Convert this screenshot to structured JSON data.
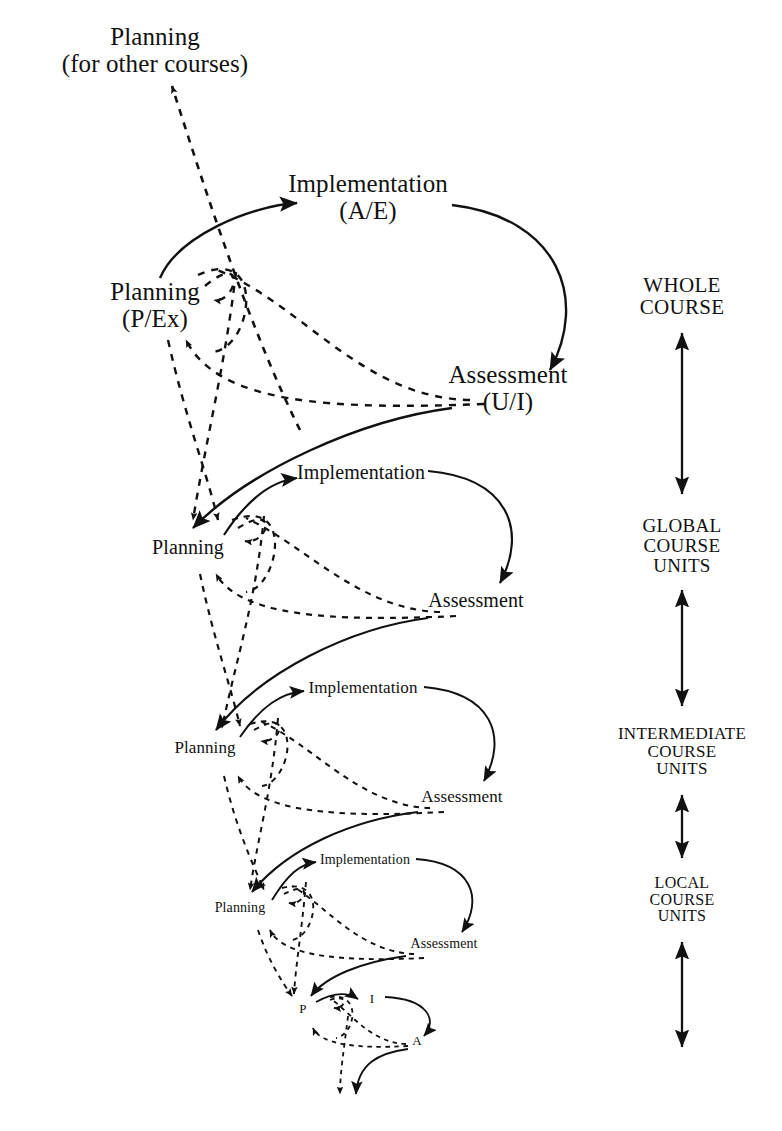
{
  "figure": {
    "background_color": "#ffffff",
    "ink_color": "#111111",
    "width": 782,
    "height": 1131
  },
  "nodes": {
    "external_planning": {
      "label": "Planning",
      "sublabel": "(for other courses)",
      "x": 155,
      "y": 50,
      "font_size": 25
    },
    "level1": {
      "planning": {
        "label": "Planning",
        "sublabel": "(P/Ex)",
        "x": 155,
        "y": 305,
        "font_size": 25
      },
      "implementation": {
        "label": "Implementation",
        "sublabel": "(A/E)",
        "x": 368,
        "y": 197,
        "font_size": 25
      },
      "assessment": {
        "label": "Assessment",
        "sublabel": "(U/I)",
        "x": 508,
        "y": 388,
        "font_size": 25
      }
    },
    "level2": {
      "planning": {
        "label": "Planning",
        "sublabel": "",
        "x": 188,
        "y": 548,
        "font_size": 20
      },
      "implementation": {
        "label": "Implementation",
        "sublabel": "",
        "x": 361,
        "y": 473,
        "font_size": 20
      },
      "assessment": {
        "label": "Assessment",
        "sublabel": "",
        "x": 476,
        "y": 601,
        "font_size": 20
      }
    },
    "level3": {
      "planning": {
        "label": "Planning",
        "sublabel": "",
        "x": 205,
        "y": 748,
        "font_size": 17
      },
      "implementation": {
        "label": "Implementation",
        "sublabel": "",
        "x": 363,
        "y": 688,
        "font_size": 17
      },
      "assessment": {
        "label": "Assessment",
        "sublabel": "",
        "x": 462,
        "y": 797,
        "font_size": 17
      }
    },
    "level4": {
      "planning": {
        "label": "Planning",
        "sublabel": "",
        "x": 240,
        "y": 908,
        "font_size": 14
      },
      "implementation": {
        "label": "Implementation",
        "sublabel": "",
        "x": 365,
        "y": 860,
        "font_size": 14
      },
      "assessment": {
        "label": "Assessment",
        "sublabel": "",
        "x": 444,
        "y": 944,
        "font_size": 14
      }
    },
    "level5": {
      "planning": {
        "label": "P",
        "sublabel": "",
        "x": 303,
        "y": 1009,
        "font_size": 13
      },
      "implementation": {
        "label": "I",
        "sublabel": "",
        "x": 372,
        "y": 999,
        "font_size": 13
      },
      "assessment": {
        "label": "A",
        "sublabel": "",
        "x": 417,
        "y": 1041,
        "font_size": 13
      }
    }
  },
  "scale_axis": {
    "x": 682,
    "labels": [
      {
        "id": "whole-course",
        "text": "WHOLE\nCOURSE",
        "x": 682,
        "y": 297,
        "font_size": 21
      },
      {
        "id": "global-course-units",
        "text": "GLOBAL\nCOURSE\nUNITS",
        "x": 682,
        "y": 546,
        "font_size": 19
      },
      {
        "id": "intermediate-course-units",
        "text": "INTERMEDIATE\nCOURSE\nUNITS",
        "x": 682,
        "y": 752,
        "font_size": 17
      },
      {
        "id": "local-course-units",
        "text": "LOCAL\nCOURSE\nUNITS",
        "x": 682,
        "y": 900,
        "font_size": 16
      }
    ],
    "arrows": [
      {
        "id": "arrow-whole-to-global",
        "x": 682,
        "y1": 333,
        "y2": 494,
        "heads": "both"
      },
      {
        "id": "arrow-global-to-intermediate",
        "x": 682,
        "y1": 590,
        "y2": 706,
        "heads": "both"
      },
      {
        "id": "arrow-intermediate-to-local",
        "x": 682,
        "y1": 795,
        "y2": 858,
        "heads": "both"
      },
      {
        "id": "arrow-local-downward",
        "x": 682,
        "y1": 942,
        "y2": 1047,
        "heads": "both"
      }
    ]
  },
  "legend_semantics": {
    "solid_line": "forward flow: planning to implementation to assessment",
    "dashed_line": "feedback flow returning to planning"
  },
  "caption": {
    "text": "",
    "visible": false
  }
}
